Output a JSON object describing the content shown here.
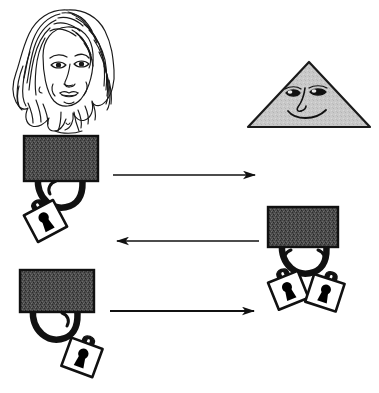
{
  "canvas": {
    "width": 379,
    "height": 393,
    "background": "#ffffff",
    "title": "Handbag and padlock transfer diagram"
  },
  "palette": {
    "ink": "#111111",
    "line": "#1a1a1a",
    "bag_fill": "#4a4a4a",
    "bag_fill_alt": "#585858",
    "triangle_fill": "#c9c9c9",
    "padlock_body": "#ffffff",
    "padlock_keyhole": "#000000",
    "background": "#ffffff"
  },
  "figures": {
    "woman": {
      "label": "woman-head-line-drawing",
      "description": "Line drawing of a woman's head with long wavy hair",
      "x": 12,
      "y": 6,
      "width": 112,
      "height": 128
    },
    "triangle": {
      "label": "smiling-triangle",
      "description": "Gray triangle with a drawn face: two eyes, a nose and a smile",
      "x": 248,
      "y": 62,
      "width": 122,
      "height": 66,
      "fill": "#c9c9c9",
      "face": {
        "eyes": 2,
        "nose": 1,
        "mouth": "smile"
      }
    },
    "bags": [
      {
        "id": "bag-top-left",
        "label": "handbag-one-padlock-left",
        "x": 24,
        "y": 136,
        "width": 74,
        "height": 45,
        "padlock_count": 1,
        "padlock_side": "left"
      },
      {
        "id": "bag-middle-right",
        "label": "handbag-two-padlocks",
        "x": 268,
        "y": 207,
        "width": 70,
        "height": 40,
        "padlock_count": 2,
        "padlock_side": "both"
      },
      {
        "id": "bag-bottom-left",
        "label": "handbag-one-padlock-right",
        "x": 20,
        "y": 270,
        "width": 74,
        "height": 42,
        "padlock_count": 1,
        "padlock_side": "right"
      }
    ],
    "arrows": [
      {
        "id": "arrow-1",
        "label": "arrow-right-top",
        "direction": "right",
        "x1": 113,
        "y1": 175,
        "x2": 259,
        "y2": 175
      },
      {
        "id": "arrow-2",
        "label": "arrow-left-middle",
        "direction": "left",
        "x1": 259,
        "y1": 241,
        "x2": 113,
        "y2": 241
      },
      {
        "id": "arrow-3",
        "label": "arrow-right-bottom",
        "direction": "right",
        "x1": 110,
        "y1": 311,
        "x2": 258,
        "y2": 311
      }
    ]
  },
  "counts": {
    "bags": 3,
    "arrows": 3,
    "padlocks_total": 4
  }
}
